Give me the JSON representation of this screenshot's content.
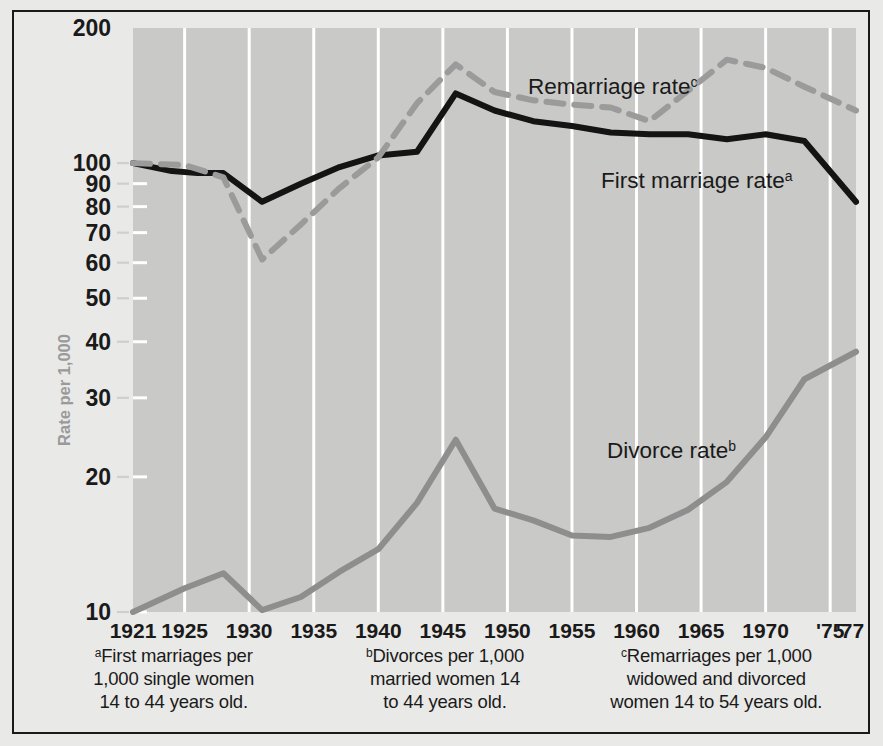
{
  "chart_data": {
    "type": "line",
    "title": "",
    "xlabel": "",
    "ylabel": "Rate per 1,000",
    "scale": "log",
    "ylim": [
      10,
      200
    ],
    "xlim": [
      1921,
      1977
    ],
    "grid": "vertical white gridlines every 5 years",
    "legend_position": "inline annotations",
    "yticks": [
      "200",
      "100",
      "90",
      "80",
      "70",
      "60",
      "50",
      "40",
      "30",
      "20",
      "10"
    ],
    "ytick_values": [
      200,
      100,
      90,
      80,
      70,
      60,
      50,
      40,
      30,
      20,
      10
    ],
    "xticks": [
      "1921",
      "1925",
      "1930",
      "1935",
      "1940",
      "1945",
      "1950",
      "1955",
      "1960",
      "1965",
      "1970",
      "'75",
      "'77"
    ],
    "xtick_values": [
      1921,
      1925,
      1930,
      1935,
      1940,
      1945,
      1950,
      1955,
      1960,
      1965,
      1970,
      1975,
      1977
    ],
    "gridline_years": [
      1925,
      1930,
      1935,
      1940,
      1945,
      1950,
      1955,
      1960,
      1965,
      1970,
      1975
    ],
    "series": [
      {
        "name": "First marriage rate",
        "annotation": "First marriage rate",
        "annotation_sup": "a",
        "color": "#141414",
        "style": "solid",
        "x": [
          1921,
          1924,
          1926,
          1928,
          1931,
          1934,
          1937,
          1940,
          1943,
          1946,
          1949,
          1952,
          1955,
          1958,
          1961,
          1964,
          1967,
          1970,
          1973,
          1977
        ],
        "values": [
          100,
          96,
          95,
          95,
          82,
          90,
          98,
          104,
          106,
          143,
          131,
          124,
          121,
          117,
          116,
          116,
          113,
          116,
          112,
          82
        ]
      },
      {
        "name": "Remarriage rate",
        "annotation": "Remarriage rate",
        "annotation_sup": "c",
        "color": "#9b9b9b",
        "style": "dashed",
        "x": [
          1921,
          1925,
          1928,
          1931,
          1934,
          1937,
          1940,
          1943,
          1946,
          1949,
          1952,
          1955,
          1958,
          1961,
          1964,
          1967,
          1970,
          1973,
          1977
        ],
        "values": [
          100,
          99,
          93,
          61,
          73,
          88,
          103,
          136,
          166,
          144,
          138,
          135,
          133,
          124,
          145,
          170,
          163,
          148,
          131
        ]
      },
      {
        "name": "Divorce rate",
        "annotation": "Divorce rate",
        "annotation_sup": "b",
        "color": "#8e8e8e",
        "style": "solid",
        "x": [
          1921,
          1925,
          1928,
          1931,
          1934,
          1937,
          1940,
          1943,
          1946,
          1949,
          1952,
          1955,
          1958,
          1961,
          1964,
          1967,
          1970,
          1973,
          1977
        ],
        "values": [
          10,
          11.3,
          12.2,
          10.1,
          10.8,
          12.3,
          13.8,
          17.5,
          24.2,
          17.0,
          16.0,
          14.8,
          14.7,
          15.4,
          16.9,
          19.5,
          24.5,
          33.0,
          38.0
        ]
      }
    ]
  },
  "axis": {
    "y_title": "Rate per 1,000"
  },
  "annotations": {
    "remarriage": {
      "text": "Remarriage rate",
      "sup": "c"
    },
    "first_marriage": {
      "text": "First marriage rate",
      "sup": "a"
    },
    "divorce": {
      "text": "Divorce rate",
      "sup": "b"
    }
  },
  "footnotes": [
    {
      "sup": "a",
      "lines": [
        "First marriages per",
        "1,000 single women",
        "14 to 44 years old."
      ]
    },
    {
      "sup": "b",
      "lines": [
        "Divorces per 1,000",
        "married women 14",
        "to 44 years old."
      ]
    },
    {
      "sup": "c",
      "lines": [
        "Remarriages per 1,000",
        "widowed and divorced",
        "women 14 to 54 years old."
      ]
    }
  ],
  "colors": {
    "page_background": "#e9e9e7",
    "plot_background": "#c9c9c7",
    "gridline": "#ffffff",
    "frame": "#1a1a1a",
    "text": "#1a1a1a",
    "axis_title": "#9a9a9a",
    "first_marriage_line": "#141414",
    "remarriage_line": "#9b9b9b",
    "divorce_line": "#8e8e8e"
  }
}
